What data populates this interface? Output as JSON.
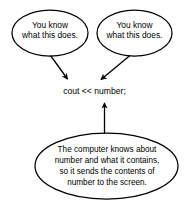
{
  "diagram": {
    "type": "annotated-code-callout-diagram",
    "canvas": {
      "width": 189,
      "height": 209,
      "background": "#ffffff"
    },
    "stroke_color": "#000000",
    "text_color": "#000000",
    "code_statement": "cout << number;",
    "bubbles": {
      "top_left": {
        "label": "You know\nwhat this does.",
        "line1": "You know",
        "line2": "what this does.",
        "shape": "ellipse"
      },
      "top_right": {
        "label": "You know\nwhat this does.",
        "line1": "You know",
        "line2": "what this does.",
        "shape": "ellipse"
      },
      "bottom": {
        "label": "The computer knows about\nnumber and what it contains,\nso it sends the contents of\nnumber to the screen.",
        "line1": "The computer knows about",
        "line2": "number and what it contains,",
        "line3": "so it sends the contents of",
        "line4": "number to the screen.",
        "shape": "ellipse"
      }
    },
    "arrows": [
      {
        "name": "arrow-left-bubble-to-code",
        "from": "top_left",
        "to": "code_statement",
        "direction": "down-right"
      },
      {
        "name": "arrow-right-bubble-to-code",
        "from": "top_right",
        "to": "code_statement",
        "direction": "down-left"
      },
      {
        "name": "arrow-bottom-bubble-to-code",
        "from": "bottom",
        "to": "code_statement",
        "direction": "up"
      }
    ]
  }
}
